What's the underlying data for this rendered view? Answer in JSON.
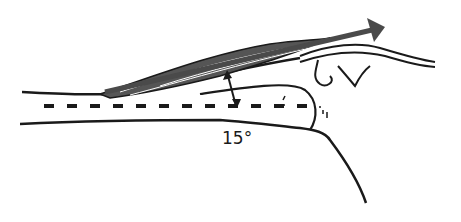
{
  "figure": {
    "angle_label": "15°",
    "colors": {
      "line": "#1a1a1a",
      "muscle_fill": "#555555",
      "arrow": "#4a4a4a",
      "background": "#ffffff"
    }
  }
}
